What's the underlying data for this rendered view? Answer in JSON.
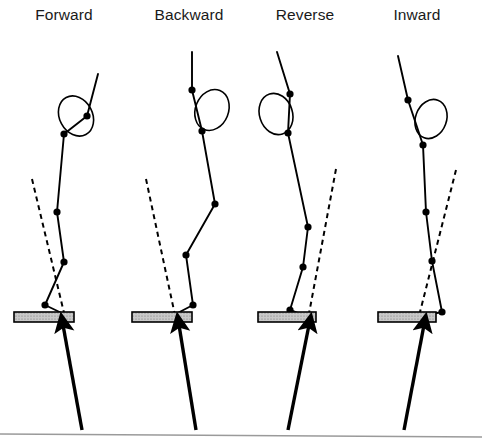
{
  "figure": {
    "name": "landing-posture-diagram",
    "width": 482,
    "height": 444,
    "background_color": "#ffffff",
    "line_color": "#000000",
    "joint_color": "#000000",
    "plate_fill_color": "#c9c9c9",
    "plate_stroke_color": "#000000",
    "dashed_color": "#000000",
    "baseline_color": "#9a9a9a"
  },
  "panels": [
    {
      "id": "forward",
      "title": "Forward",
      "title_x": 64,
      "title_y": 20,
      "body_polyline": "98,74 87,116 64,134 57,212 64,262 45,305 72,318",
      "head_ellipse": {
        "cx": 76,
        "cy": 116,
        "rx": 16.5,
        "ry": 21,
        "rotation": -28
      },
      "joints": [
        {
          "name": "hand",
          "x": 87,
          "y": 116
        },
        {
          "name": "shoulder",
          "x": 64,
          "y": 134
        },
        {
          "name": "hip",
          "x": 57,
          "y": 212
        },
        {
          "name": "knee",
          "x": 64,
          "y": 262
        },
        {
          "name": "ankle",
          "x": 45,
          "y": 305
        }
      ],
      "dashed_line": {
        "x1": 32,
        "y1": 179,
        "x2": 65,
        "y2": 317
      },
      "plate": {
        "x": 14,
        "y": 312,
        "width": 60,
        "height": 10
      },
      "arrow": {
        "x1": 82,
        "y1": 430,
        "x2": 63,
        "y2": 325
      }
    },
    {
      "id": "backward",
      "title": "Backward",
      "title_x": 189,
      "title_y": 20,
      "body_polyline": "192,52 192,90 202,131 215,204 186,255 193,305 168,318",
      "head_ellipse": {
        "cx": 212,
        "cy": 110,
        "rx": 16.5,
        "ry": 21,
        "rotation": 22
      },
      "joints": [
        {
          "name": "hand",
          "x": 192,
          "y": 90
        },
        {
          "name": "shoulder",
          "x": 202,
          "y": 131
        },
        {
          "name": "hip",
          "x": 215,
          "y": 204
        },
        {
          "name": "knee",
          "x": 186,
          "y": 255
        },
        {
          "name": "ankle",
          "x": 193,
          "y": 305
        }
      ],
      "dashed_line": {
        "x1": 146,
        "y1": 179,
        "x2": 176,
        "y2": 320
      },
      "plate": {
        "x": 132,
        "y": 312,
        "width": 60,
        "height": 10
      },
      "arrow": {
        "x1": 196,
        "y1": 430,
        "x2": 179,
        "y2": 325
      }
    },
    {
      "id": "reverse",
      "title": "Reverse",
      "title_x": 305,
      "title_y": 20,
      "body_polyline": "277,52 290,94 288,133 308,227 303,267 290,310 313,319",
      "head_ellipse": {
        "cx": 276,
        "cy": 114,
        "rx": 16.5,
        "ry": 21,
        "rotation": -18
      },
      "joints": [
        {
          "name": "hand",
          "x": 290,
          "y": 94
        },
        {
          "name": "shoulder",
          "x": 288,
          "y": 133
        },
        {
          "name": "hip",
          "x": 308,
          "y": 227
        },
        {
          "name": "knee",
          "x": 303,
          "y": 267
        },
        {
          "name": "ankle",
          "x": 290,
          "y": 310
        }
      ],
      "dashed_line": {
        "x1": 336,
        "y1": 169,
        "x2": 308,
        "y2": 319
      },
      "plate": {
        "x": 258,
        "y": 312,
        "width": 58,
        "height": 10
      },
      "arrow": {
        "x1": 288,
        "y1": 430,
        "x2": 309,
        "y2": 325
      }
    },
    {
      "id": "inward",
      "title": "Inward",
      "title_x": 417,
      "title_y": 20,
      "body_polyline": "398,56 408,100 423,145 426,212 432,261 442,312 412,318",
      "head_ellipse": {
        "cx": 431,
        "cy": 119,
        "rx": 15.5,
        "ry": 20,
        "rotation": 20
      },
      "joints": [
        {
          "name": "hand",
          "x": 408,
          "y": 100
        },
        {
          "name": "shoulder",
          "x": 423,
          "y": 145
        },
        {
          "name": "hip",
          "x": 426,
          "y": 212
        },
        {
          "name": "knee",
          "x": 432,
          "y": 261
        },
        {
          "name": "ankle",
          "x": 442,
          "y": 312
        }
      ],
      "dashed_line": {
        "x1": 456,
        "y1": 170,
        "x2": 418,
        "y2": 320
      },
      "plate": {
        "x": 378,
        "y": 312,
        "width": 58,
        "height": 10
      },
      "arrow": {
        "x1": 404,
        "y1": 430,
        "x2": 424,
        "y2": 325
      }
    }
  ],
  "baseline": {
    "x1": 0,
    "y1": 434,
    "x2": 482,
    "y2": 437
  }
}
